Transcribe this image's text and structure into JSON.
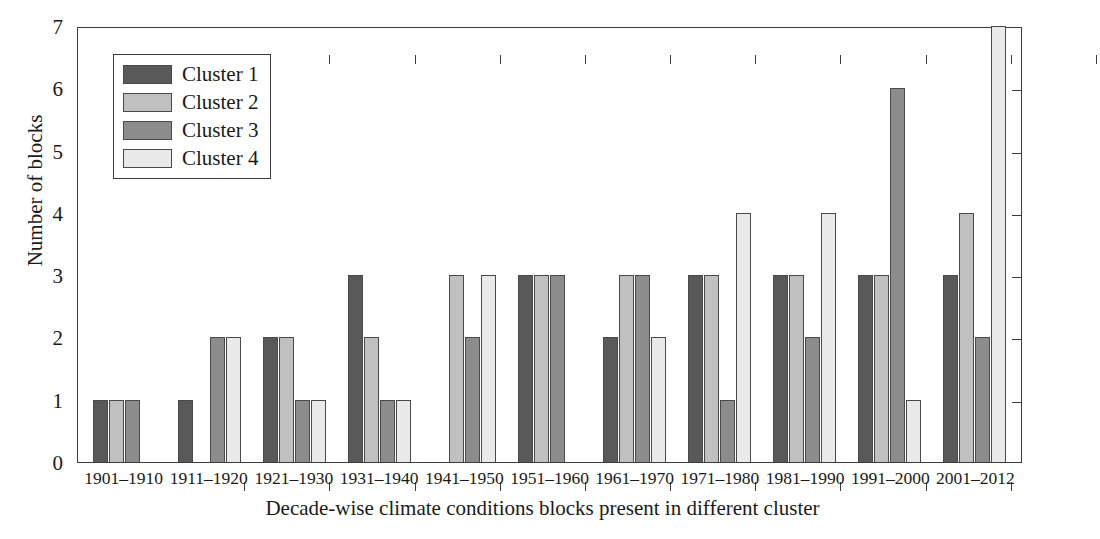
{
  "chart_data": {
    "type": "bar",
    "title": "",
    "xlabel": "Decade-wise climate conditions blocks present in different cluster",
    "ylabel": "Number of blocks",
    "ylim": [
      0,
      7
    ],
    "yticks": [
      0,
      1,
      2,
      3,
      4,
      5,
      6,
      7
    ],
    "grid": false,
    "legend_position": "upper left",
    "categories": [
      "1901–1910",
      "1911–1920",
      "1921–1930",
      "1931–1940",
      "1941–1950",
      "1951–1960",
      "1961–1970",
      "1971–1980",
      "1981–1990",
      "1991–2000",
      "2001–2012"
    ],
    "series": [
      {
        "name": "Cluster 1",
        "color": "#595959",
        "values": [
          1,
          1,
          2,
          3,
          0,
          3,
          2,
          3,
          3,
          3,
          3
        ]
      },
      {
        "name": "Cluster 2",
        "color": "#c0c0c0",
        "values": [
          1,
          0,
          2,
          2,
          3,
          3,
          3,
          3,
          3,
          3,
          4
        ]
      },
      {
        "name": "Cluster 3",
        "color": "#8c8c8c",
        "values": [
          1,
          2,
          1,
          1,
          2,
          3,
          3,
          1,
          2,
          6,
          2
        ]
      },
      {
        "name": "Cluster 4",
        "color": "#e9e9e9",
        "values": [
          0,
          2,
          1,
          1,
          3,
          0,
          2,
          4,
          4,
          1,
          7
        ]
      }
    ]
  },
  "axes": {
    "y_tick_labels": [
      "0",
      "1",
      "2",
      "3",
      "4",
      "5",
      "6",
      "7"
    ],
    "y_axis_title": "Number of blocks",
    "x_axis_title": "Decade-wise climate conditions blocks present in different cluster"
  },
  "legend": {
    "entries": [
      {
        "label": "Cluster 1",
        "color": "#595959"
      },
      {
        "label": "Cluster 2",
        "color": "#c0c0c0"
      },
      {
        "label": "Cluster 3",
        "color": "#8c8c8c"
      },
      {
        "label": "Cluster 4",
        "color": "#e9e9e9"
      }
    ]
  },
  "style": {
    "background": "#ffffff",
    "axis_color": "#3c3c3c",
    "bar_edge_color": "#4a4a4a"
  }
}
